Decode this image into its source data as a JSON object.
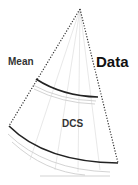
{
  "diagram": {
    "labels": {
      "mean": "Mean",
      "data": "Data",
      "dcs": "DCS"
    },
    "colors": {
      "outline_dotted": "#333333",
      "arc_dark": "#222222",
      "ghost_lines": "#cccccc"
    },
    "shape": "fan-sector",
    "regions": [
      "Data",
      "Mean",
      "DCS"
    ]
  }
}
